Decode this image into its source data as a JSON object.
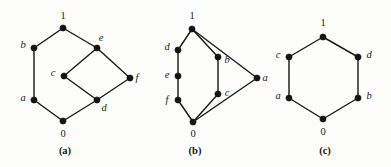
{
  "figure": {
    "background_color": "#fdfdfc",
    "edge_color": "#1b1b1b",
    "node_color": "#141414",
    "label_color": "#1a1a1a"
  },
  "diagrams": [
    {
      "id": "diagram-a",
      "caption": "(a)",
      "caption_pos": {
        "x": 65,
        "y": 151
      },
      "nodes": [
        {
          "id": "a-top",
          "label": "1",
          "numeric": true,
          "x": 63,
          "y": 28,
          "label_x": 63,
          "label_y": 16
        },
        {
          "id": "a-b",
          "label": "b",
          "numeric": false,
          "x": 34,
          "y": 48,
          "label_x": 23,
          "label_y": 45
        },
        {
          "id": "a-e",
          "label": "e",
          "numeric": false,
          "x": 97,
          "y": 48,
          "label_x": 101,
          "label_y": 38
        },
        {
          "id": "a-c",
          "label": "c",
          "numeric": false,
          "x": 64,
          "y": 76,
          "label_x": 53,
          "label_y": 73
        },
        {
          "id": "a-f",
          "label": "f",
          "numeric": false,
          "x": 130,
          "y": 78,
          "label_x": 137,
          "label_y": 78
        },
        {
          "id": "a-a",
          "label": "a",
          "numeric": false,
          "x": 34,
          "y": 100,
          "label_x": 23,
          "label_y": 98
        },
        {
          "id": "a-d",
          "label": "d",
          "numeric": false,
          "x": 97,
          "y": 100,
          "label_x": 104,
          "label_y": 108
        },
        {
          "id": "a-bot",
          "label": "0",
          "numeric": true,
          "x": 63,
          "y": 121,
          "label_x": 63,
          "label_y": 134
        }
      ],
      "edges": [
        [
          "a-bot",
          "a-a"
        ],
        [
          "a-a",
          "a-b"
        ],
        [
          "a-b",
          "a-top"
        ],
        [
          "a-top",
          "a-e"
        ],
        [
          "a-e",
          "a-c"
        ],
        [
          "a-e",
          "a-f"
        ],
        [
          "a-c",
          "a-d"
        ],
        [
          "a-d",
          "a-f"
        ],
        [
          "a-d",
          "a-bot"
        ]
      ]
    },
    {
      "id": "diagram-b",
      "caption": "(b)",
      "caption_pos": {
        "x": 195,
        "y": 151
      },
      "nodes": [
        {
          "id": "b-top",
          "label": "1",
          "numeric": true,
          "x": 192,
          "y": 29,
          "label_x": 192,
          "label_y": 16
        },
        {
          "id": "b-d",
          "label": "d",
          "numeric": false,
          "x": 178,
          "y": 50,
          "label_x": 167,
          "label_y": 47
        },
        {
          "id": "b-b",
          "label": "b",
          "numeric": false,
          "x": 218,
          "y": 57,
          "label_x": 227,
          "label_y": 60
        },
        {
          "id": "b-e",
          "label": "e",
          "numeric": false,
          "x": 178,
          "y": 76,
          "label_x": 167,
          "label_y": 75
        },
        {
          "id": "b-a",
          "label": "a",
          "numeric": false,
          "x": 257,
          "y": 78,
          "label_x": 265,
          "label_y": 78
        },
        {
          "id": "b-c",
          "label": "c",
          "numeric": false,
          "x": 218,
          "y": 94,
          "label_x": 227,
          "label_y": 93
        },
        {
          "id": "b-f",
          "label": "f",
          "numeric": false,
          "x": 178,
          "y": 100,
          "label_x": 167,
          "label_y": 100
        },
        {
          "id": "b-bot",
          "label": "0",
          "numeric": true,
          "x": 193,
          "y": 122,
          "label_x": 193,
          "label_y": 134
        }
      ],
      "edges": [
        [
          "b-top",
          "b-d"
        ],
        [
          "b-top",
          "b-b"
        ],
        [
          "b-top",
          "b-a"
        ],
        [
          "b-d",
          "b-e"
        ],
        [
          "b-e",
          "b-f"
        ],
        [
          "b-f",
          "b-bot"
        ],
        [
          "b-b",
          "b-c"
        ],
        [
          "b-c",
          "b-bot"
        ],
        [
          "b-a",
          "b-bot"
        ]
      ]
    },
    {
      "id": "diagram-c",
      "caption": "(c)",
      "caption_pos": {
        "x": 325,
        "y": 151
      },
      "nodes": [
        {
          "id": "c-top",
          "label": "1",
          "numeric": true,
          "x": 323,
          "y": 37,
          "label_x": 323,
          "label_y": 23
        },
        {
          "id": "c-c",
          "label": "c",
          "numeric": false,
          "x": 289,
          "y": 57,
          "label_x": 278,
          "label_y": 55
        },
        {
          "id": "c-d",
          "label": "d",
          "numeric": false,
          "x": 358,
          "y": 57,
          "label_x": 369,
          "label_y": 55
        },
        {
          "id": "c-a",
          "label": "a",
          "numeric": false,
          "x": 289,
          "y": 98,
          "label_x": 278,
          "label_y": 96
        },
        {
          "id": "c-b",
          "label": "b",
          "numeric": false,
          "x": 358,
          "y": 98,
          "label_x": 369,
          "label_y": 96
        },
        {
          "id": "c-bot",
          "label": "0",
          "numeric": true,
          "x": 323,
          "y": 119,
          "label_x": 323,
          "label_y": 132
        }
      ],
      "edges": [
        [
          "c-top",
          "c-c"
        ],
        [
          "c-top",
          "c-d"
        ],
        [
          "c-c",
          "c-a"
        ],
        [
          "c-d",
          "c-b"
        ],
        [
          "c-a",
          "c-bot"
        ],
        [
          "c-b",
          "c-bot"
        ]
      ]
    }
  ]
}
